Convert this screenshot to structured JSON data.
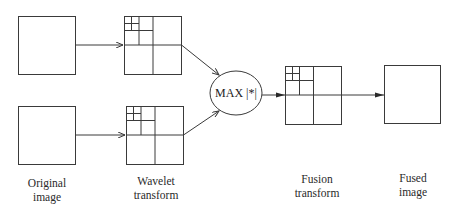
{
  "diagram": {
    "title": "",
    "stroke_color": "#3a3a3a",
    "nodes": {
      "original_top": {
        "label": ""
      },
      "original_bottom": {
        "label": ""
      },
      "wavelet_top": {
        "label": ""
      },
      "wavelet_bottom": {
        "label": ""
      },
      "max_operator": {
        "label": "MAX |*|"
      },
      "fusion_transform": {
        "label": ""
      },
      "fused_image": {
        "label": ""
      }
    },
    "edges": [
      {
        "from": "original_top",
        "to": "wavelet_top"
      },
      {
        "from": "original_bottom",
        "to": "wavelet_bottom"
      },
      {
        "from": "wavelet_top",
        "to": "max_operator"
      },
      {
        "from": "wavelet_bottom",
        "to": "max_operator"
      },
      {
        "from": "max_operator",
        "to": "fusion_transform"
      },
      {
        "from": "fusion_transform",
        "to": "fused_image"
      }
    ],
    "captions": {
      "original": {
        "line1": "Original",
        "line2": "image"
      },
      "wavelet": {
        "line1": "Wavelet",
        "line2": "transform"
      },
      "fusion": {
        "line1": "Fusion",
        "line2": "transform"
      },
      "fused": {
        "line1": "Fused",
        "line2": "image"
      }
    }
  }
}
